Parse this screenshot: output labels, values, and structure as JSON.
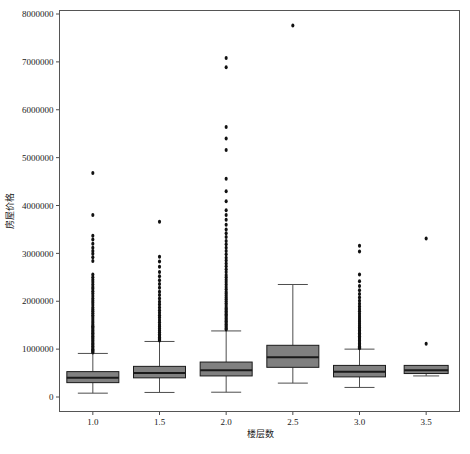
{
  "chart_data": {
    "type": "box",
    "title": "",
    "xlabel": "楼层数",
    "ylabel": "房屋价格",
    "xtick_labels": [
      "1.0",
      "1.5",
      "2.0",
      "2.5",
      "3.0",
      "3.5"
    ],
    "ytick_labels": [
      "0",
      "1000000",
      "2000000",
      "3000000",
      "4000000",
      "5000000",
      "6000000",
      "7000000",
      "8000000"
    ],
    "ytick_values": [
      0,
      1000000,
      2000000,
      3000000,
      4000000,
      5000000,
      6000000,
      7000000,
      8000000
    ],
    "ylim": [
      0,
      8000000
    ],
    "xlim": [
      0.75,
      3.75
    ],
    "grid": false,
    "legend": null,
    "box_facecolor": "#808080",
    "box_edgecolor": "#1a1a1a",
    "median_color": "#1a1a1a",
    "whisker_color": "#4d4d4d",
    "flier_color": "#111111",
    "categories": [
      {
        "label": "1.0",
        "x": 1.0,
        "q1": 300000,
        "median": 400000,
        "q3": 530000,
        "whisker_low": 80000,
        "whisker_high": 910000,
        "fliers": [
          4680000,
          3800000,
          3370000,
          3290000,
          3200000,
          3120000,
          3050000,
          2990000,
          2920000,
          2840000,
          2560000,
          2500000,
          2450000,
          2400000,
          2350000,
          2300000,
          2260000,
          2210000,
          2160000,
          2110000,
          2060000,
          2010000,
          1970000,
          1920000,
          1870000,
          1830000,
          1790000,
          1750000,
          1710000,
          1670000,
          1630000,
          1590000,
          1550000,
          1510000,
          1480000,
          1450000,
          1420000,
          1390000,
          1360000,
          1330000,
          1300000,
          1270000,
          1240000,
          1210000,
          1180000,
          1150000,
          1120000,
          1090000,
          1060000,
          1030000,
          1000000,
          975000,
          950000,
          930000
        ]
      },
      {
        "label": "1.5",
        "x": 1.5,
        "q1": 400000,
        "median": 500000,
        "q3": 640000,
        "whisker_low": 95000,
        "whisker_high": 1160000,
        "fliers": [
          3660000,
          2930000,
          2830000,
          2720000,
          2610000,
          2520000,
          2440000,
          2360000,
          2280000,
          2200000,
          2130000,
          2060000,
          1990000,
          1930000,
          1870000,
          1810000,
          1760000,
          1710000,
          1660000,
          1610000,
          1560000,
          1510000,
          1470000,
          1430000,
          1390000,
          1350000,
          1310000,
          1280000,
          1250000,
          1220000,
          1200000,
          1180000
        ]
      },
      {
        "label": "2.0",
        "x": 2.0,
        "q1": 440000,
        "median": 560000,
        "q3": 730000,
        "whisker_low": 100000,
        "whisker_high": 1380000,
        "fliers": [
          7080000,
          6890000,
          5640000,
          5400000,
          5160000,
          4560000,
          4300000,
          4090000,
          3900000,
          3800000,
          3700000,
          3600000,
          3500000,
          3420000,
          3340000,
          3260000,
          3190000,
          3120000,
          3050000,
          2980000,
          2910000,
          2850000,
          2790000,
          2730000,
          2670000,
          2610000,
          2550000,
          2500000,
          2450000,
          2400000,
          2350000,
          2300000,
          2250000,
          2200000,
          2160000,
          2120000,
          2080000,
          2040000,
          2000000,
          1960000,
          1920000,
          1880000,
          1850000,
          1820000,
          1790000,
          1760000,
          1730000,
          1700000,
          1670000,
          1640000,
          1610000,
          1580000,
          1550000,
          1520000,
          1490000,
          1460000,
          1430000,
          1410000
        ]
      },
      {
        "label": "2.5",
        "x": 2.5,
        "q1": 620000,
        "median": 830000,
        "q3": 1080000,
        "whisker_low": 290000,
        "whisker_high": 2350000,
        "fliers": [
          7760000
        ]
      },
      {
        "label": "3.0",
        "x": 3.0,
        "q1": 420000,
        "median": 530000,
        "q3": 660000,
        "whisker_low": 200000,
        "whisker_high": 1000000,
        "fliers": [
          3160000,
          3040000,
          2560000,
          2420000,
          2320000,
          2230000,
          2150000,
          2080000,
          2010000,
          1950000,
          1890000,
          1840000,
          1790000,
          1740000,
          1690000,
          1650000,
          1610000,
          1570000,
          1530000,
          1490000,
          1450000,
          1420000,
          1390000,
          1360000,
          1330000,
          1300000,
          1270000,
          1240000,
          1210000,
          1180000,
          1150000,
          1120000,
          1090000,
          1060000,
          1040000,
          1020000
        ]
      },
      {
        "label": "3.5",
        "x": 3.5,
        "q1": 490000,
        "median": 560000,
        "q3": 660000,
        "whisker_low": 440000,
        "whisker_high": 620000,
        "fliers": [
          3310000,
          1110000
        ]
      }
    ]
  }
}
